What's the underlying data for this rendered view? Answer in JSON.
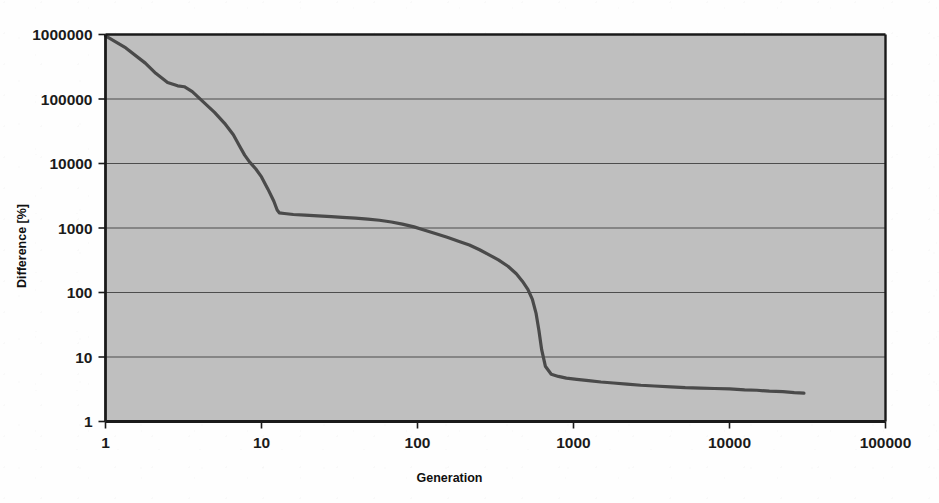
{
  "figure": {
    "background_color": "#fefefe",
    "plot_background_color": "#bfbfbf",
    "frame_color": "#1a1a1a",
    "gridline_color": "#4d4d4d",
    "series_color": "#4a4a4a"
  },
  "chart_data": {
    "type": "line",
    "title": "",
    "subtitle": "",
    "xlabel": "Generation",
    "ylabel": "Difference [%]",
    "xscale": "log",
    "yscale": "log",
    "xlim": [
      1,
      100000
    ],
    "ylim": [
      1,
      1000000
    ],
    "xticks": [
      1,
      10,
      100,
      1000,
      10000,
      100000
    ],
    "xtick_labels": [
      "1",
      "10",
      "100",
      "1000",
      "10000",
      "100000"
    ],
    "yticks": [
      1,
      10,
      100,
      1000,
      10000,
      100000,
      1000000
    ],
    "ytick_labels": [
      "1",
      "10",
      "100",
      "1000",
      "10000",
      "100000",
      "1000000"
    ],
    "grid": {
      "horizontal": true,
      "vertical": false
    },
    "legend": {
      "visible": false,
      "position": "none",
      "entries": []
    },
    "annotations": [],
    "series": [
      {
        "name": "Difference",
        "color": "#4a4a4a",
        "line_width": 3.2,
        "markers": false,
        "x": [
          1,
          1.35,
          1.8,
          2.1,
          2.5,
          2.9,
          3.2,
          3.6,
          4.2,
          5,
          5.8,
          6.6,
          7.2,
          7.8,
          8.4,
          9.2,
          10,
          11,
          12,
          12.6,
          13,
          14,
          16,
          19,
          23,
          28,
          33,
          40,
          48,
          57,
          68,
          80,
          95,
          110,
          130,
          155,
          185,
          215,
          250,
          290,
          330,
          380,
          430,
          470,
          510,
          545,
          575,
          600,
          625,
          660,
          720,
          800,
          900,
          1050,
          1250,
          1500,
          1800,
          2200,
          2700,
          3300,
          4200,
          5200,
          6500,
          8000,
          10000,
          12500,
          15000,
          18000,
          22000,
          26000,
          30000
        ],
        "y": [
          950000,
          620000,
          360000,
          250000,
          180000,
          160000,
          155000,
          130000,
          92000,
          62000,
          42000,
          28000,
          19000,
          13500,
          10500,
          8200,
          6200,
          4000,
          2600,
          1900,
          1720,
          1680,
          1620,
          1580,
          1540,
          1500,
          1460,
          1420,
          1370,
          1320,
          1240,
          1150,
          1040,
          930,
          820,
          720,
          620,
          545,
          460,
          380,
          320,
          255,
          195,
          150,
          112,
          78,
          48,
          26,
          13,
          7.2,
          5.4,
          5.0,
          4.7,
          4.5,
          4.3,
          4.1,
          3.95,
          3.8,
          3.65,
          3.55,
          3.45,
          3.35,
          3.3,
          3.25,
          3.2,
          3.1,
          3.05,
          2.95,
          2.9,
          2.8,
          2.75
        ]
      }
    ]
  }
}
